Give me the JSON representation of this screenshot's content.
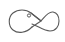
{
  "icon": {
    "name": "fish-knot-icon",
    "stroke_color": "#5a5a5a",
    "background": "#ffffff"
  }
}
